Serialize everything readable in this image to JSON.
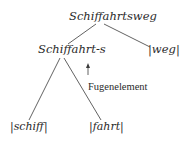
{
  "diagram": {
    "root": {
      "label": "Schiffahrtsweg"
    },
    "children": [
      {
        "label": "Schiffahrt-s",
        "children": [
          {
            "label": "|schiff|"
          },
          {
            "label": "|fahrt|"
          }
        ]
      },
      {
        "label": "|weg|"
      }
    ],
    "annotation": {
      "arrow": "↑",
      "label": "Fugenelement"
    },
    "colors": {
      "ink": "#2a2a2a",
      "background": "#ffffff"
    }
  }
}
